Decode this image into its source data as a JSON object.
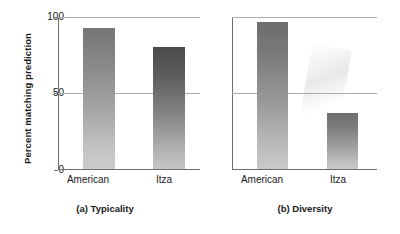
{
  "figure": {
    "ylabel": "Percent matching prediction",
    "y_ticks": [
      "100",
      "50",
      "0"
    ]
  },
  "panels": [
    {
      "caption": "(a) Typicality",
      "categories": [
        "American",
        "Itza"
      ],
      "values": [
        93,
        80
      ]
    },
    {
      "caption": "(b) Diversity",
      "categories": [
        "American",
        "Itza"
      ],
      "values": [
        97,
        37
      ]
    }
  ],
  "chart_data": {
    "type": "bar",
    "title": "",
    "subtitle": "",
    "xlabel": "",
    "ylabel": "Percent matching prediction",
    "ylim": [
      0,
      100
    ],
    "yticks": [
      0,
      50,
      100
    ],
    "grid": true,
    "legend": "none",
    "categories": [
      "American",
      "Itza"
    ],
    "panels": [
      {
        "label": "(a) Typicality",
        "categories": [
          "American",
          "Itza"
        ],
        "values": [
          93,
          80
        ]
      },
      {
        "label": "(b) Diversity",
        "categories": [
          "American",
          "Itza"
        ],
        "values": [
          97,
          37
        ]
      }
    ],
    "colors": {
      "bar_top": "#757575",
      "bar_bottom": "#cccccc",
      "axis": "#6e6e6e",
      "gridline": "#adadad",
      "text": "#1a1a1a"
    }
  }
}
